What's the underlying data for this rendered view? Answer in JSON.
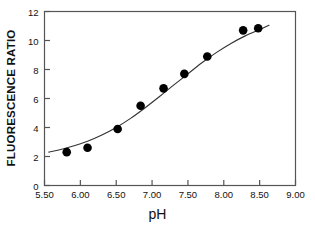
{
  "chart_data": {
    "type": "scatter",
    "title": "",
    "xlabel": "pH",
    "ylabel": "FLUORESCENCE RATIO",
    "xlim": [
      5.5,
      9.0
    ],
    "ylim": [
      0,
      12
    ],
    "xticks": [
      5.5,
      6.0,
      6.5,
      7.0,
      7.5,
      8.0,
      8.5,
      9.0
    ],
    "xtick_labels": [
      "5.50",
      "6.00",
      "6.50",
      "7.00",
      "7.50",
      "8.00",
      "8.50",
      "9.00"
    ],
    "yticks": [
      0,
      2,
      4,
      6,
      8,
      10,
      12
    ],
    "ytick_labels": [
      "0",
      "2",
      "4",
      "6",
      "8",
      "10",
      "12"
    ],
    "grid": false,
    "legend": "none",
    "marker": "filled-circle",
    "marker_color": "#000000",
    "line_color": "#333333",
    "axis_color": "#555555",
    "points": [
      {
        "x": 5.81,
        "y": 2.3
      },
      {
        "x": 6.1,
        "y": 2.6
      },
      {
        "x": 6.52,
        "y": 3.9
      },
      {
        "x": 6.84,
        "y": 5.5
      },
      {
        "x": 7.16,
        "y": 6.7
      },
      {
        "x": 7.45,
        "y": 7.7
      },
      {
        "x": 7.77,
        "y": 8.9
      },
      {
        "x": 8.27,
        "y": 10.7
      },
      {
        "x": 8.48,
        "y": 10.85
      }
    ],
    "fit_curve": {
      "description": "sigmoid fit",
      "x": [
        5.56,
        5.7,
        5.9,
        6.1,
        6.3,
        6.5,
        6.7,
        6.9,
        7.1,
        7.3,
        7.5,
        7.7,
        7.9,
        8.1,
        8.3,
        8.5,
        8.63
      ],
      "y": [
        2.3,
        2.45,
        2.72,
        3.05,
        3.48,
        4.0,
        4.63,
        5.35,
        6.12,
        6.92,
        7.7,
        8.48,
        9.18,
        9.8,
        10.32,
        10.75,
        11.05
      ]
    }
  },
  "axes": {
    "x_axis_label": "pH",
    "y_axis_label": "FLUORESCENCE RATIO"
  }
}
